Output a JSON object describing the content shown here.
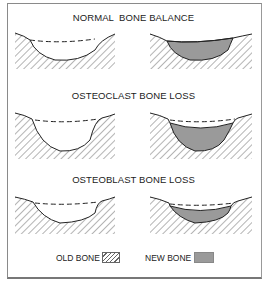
{
  "figure": {
    "panels": [
      {
        "title": "NORMAL  BONE BALANCE",
        "left": {
          "state": "resorption-pit",
          "description": "old bone with pit; dashed line marks original surface"
        },
        "right": {
          "state": "refilled",
          "description": "pit fully filled with new bone up to original surface"
        }
      },
      {
        "title": "OSTEOCLAST BONE LOSS",
        "left": {
          "state": "deep-resorption-pit",
          "description": "deeper pit; dashed line marks original surface"
        },
        "right": {
          "state": "partially-refilled",
          "description": "new bone fills pit but stays below original surface"
        }
      },
      {
        "title": "OSTEOBLAST BONE LOSS",
        "left": {
          "state": "resorption-pit",
          "description": "normal-depth pit; dashed line marks original surface"
        },
        "right": {
          "state": "under-refilled",
          "description": "thin layer of new bone, well below original surface"
        }
      }
    ],
    "legend": {
      "old_bone_label": "OLD BONE",
      "old_bone_pattern": "diagonal-hatch",
      "new_bone_label": "NEW BONE",
      "new_bone_color": "#9a9a9a"
    }
  },
  "colors": {
    "line": "#222222",
    "hatch": "#6a6a6a",
    "new_bone_fill": "#9a9a9a",
    "frame": "#8a8a8a"
  }
}
